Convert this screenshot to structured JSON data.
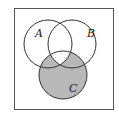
{
  "diagram": {
    "type": "venn",
    "sets": [
      {
        "label": "A"
      },
      {
        "label": "B"
      },
      {
        "label": "C"
      }
    ],
    "shaded_region": "C minus (A ∩ B)",
    "colors": {
      "shade": "#b8b8b8",
      "stroke": "#333333",
      "background": "#ffffff"
    }
  }
}
